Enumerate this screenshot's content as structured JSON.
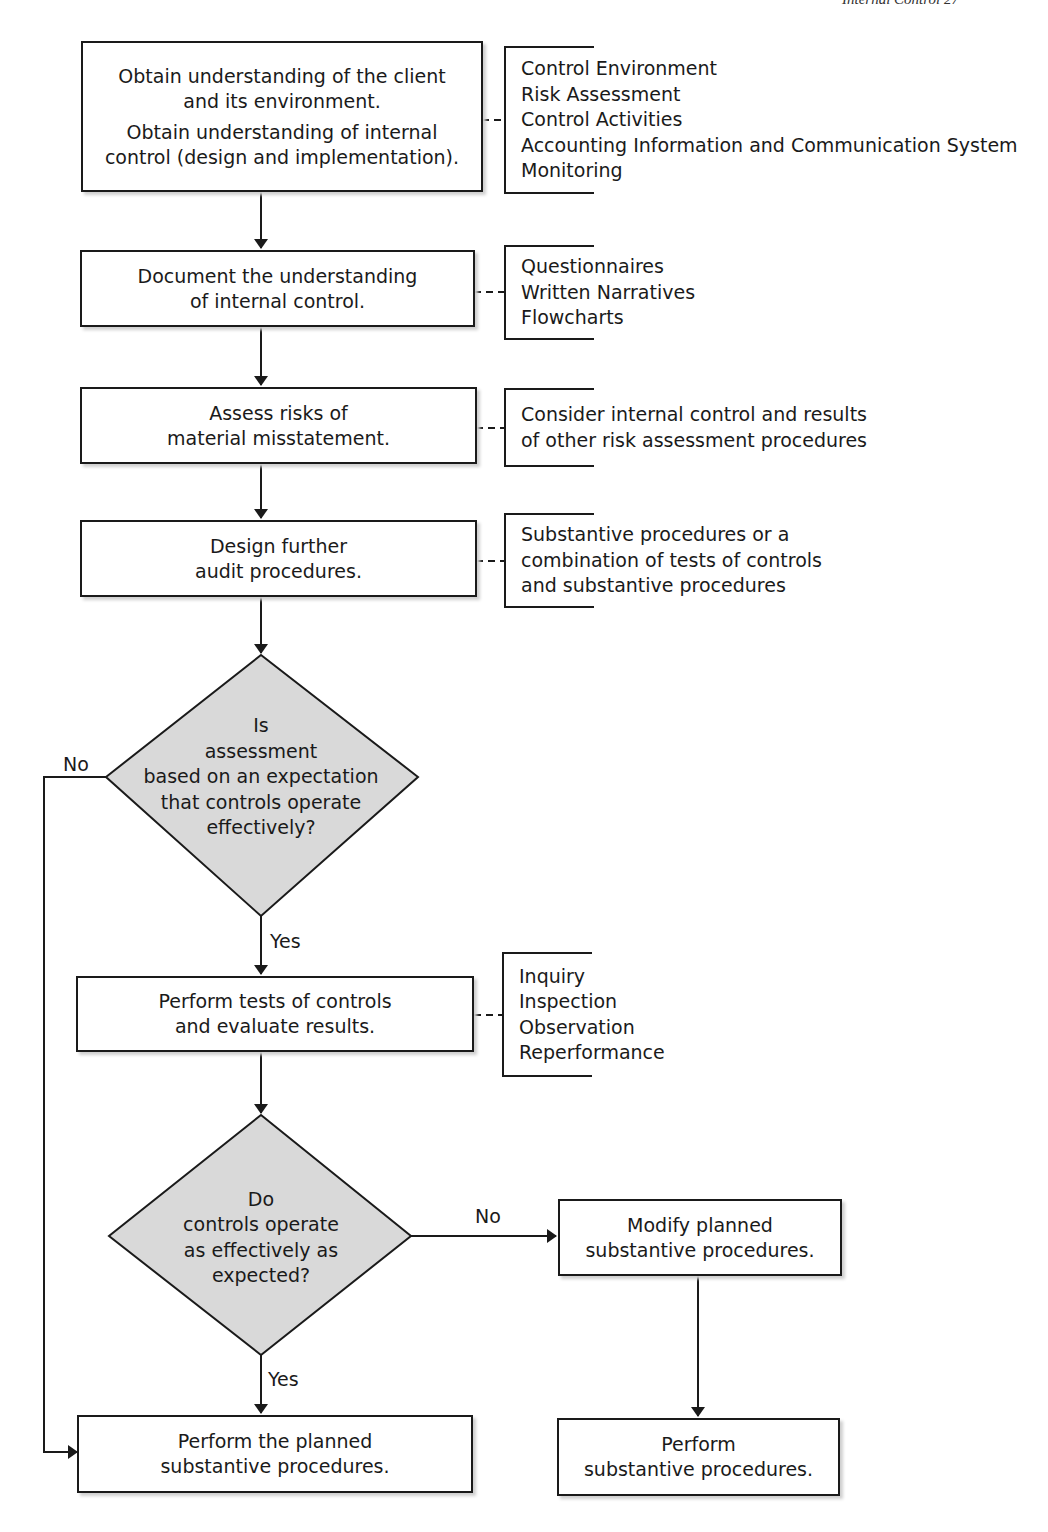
{
  "page": {
    "running_head": "Internal Control  27"
  },
  "flowchart": {
    "steps": [
      {
        "id": "understand",
        "lines": [
          "Obtain understanding of the client",
          "and its environment.",
          "Obtain understanding of internal",
          "control (design and implementation)."
        ],
        "note": [
          "Control Environment",
          "Risk Assessment",
          "Control Activities",
          "Accounting Information and Communication System",
          "Monitoring"
        ]
      },
      {
        "id": "document",
        "lines": [
          "Document the understanding",
          "of internal control."
        ],
        "note": [
          "Questionnaires",
          "Written Narratives",
          "Flowcharts"
        ]
      },
      {
        "id": "assess",
        "lines": [
          "Assess risks of",
          "material misstatement."
        ],
        "note": [
          "Consider internal control and results",
          "of other risk assessment procedures"
        ]
      },
      {
        "id": "design",
        "lines": [
          "Design further",
          "audit procedures."
        ],
        "note": [
          "Substantive procedures or a",
          "combination of tests of controls",
          "and substantive procedures"
        ]
      },
      {
        "id": "tests",
        "lines": [
          "Perform tests of controls",
          "and evaluate results."
        ],
        "note": [
          "Inquiry",
          "Inspection",
          "Observation",
          "Reperformance"
        ]
      },
      {
        "id": "modify",
        "lines": [
          "Modify planned",
          "substantive procedures."
        ]
      },
      {
        "id": "perform-planned",
        "lines": [
          "Perform the planned",
          "substantive procedures."
        ]
      },
      {
        "id": "perform",
        "lines": [
          "Perform",
          "substantive procedures."
        ]
      }
    ],
    "decisions": [
      {
        "id": "expectation",
        "lines": [
          "Is",
          "assessment",
          "based on an expectation",
          "that controls operate",
          "effectively?"
        ],
        "yes_label": "Yes",
        "no_label": "No"
      },
      {
        "id": "operate",
        "lines": [
          "Do",
          "controls operate",
          "as effectively as",
          "expected?"
        ],
        "yes_label": "Yes",
        "no_label": "No"
      }
    ],
    "colors": {
      "line": "#1a1a1a",
      "decision_fill": "#d9d9d9",
      "box_fill": "#ffffff"
    }
  }
}
